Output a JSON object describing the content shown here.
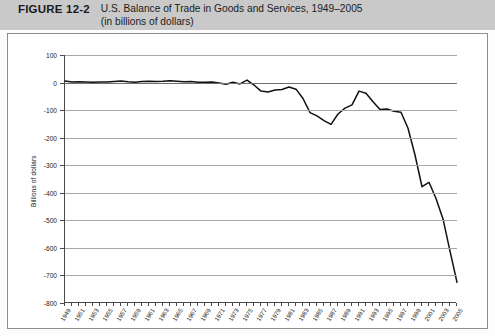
{
  "header": {
    "figure_label": "FIGURE 12-2",
    "title_line1": "U.S. Balance of Trade in Goods and Services, 1949–2005",
    "title_line2": "(in billions of dollars)"
  },
  "colors": {
    "header_band": "#c9c9c9",
    "line": "#111111",
    "grid": "#a8a8a8",
    "axis": "#4a4a4a",
    "plot_background": "#ffffff"
  },
  "chart_data": {
    "type": "line",
    "title": "U.S. Balance of Trade in Goods and Services, 1949–2005",
    "subtitle": "(in billions of dollars)",
    "xlabel": "",
    "ylabel": "Billions of dollars",
    "ylim": [
      -800,
      100
    ],
    "xlim": [
      1949,
      2005
    ],
    "grid": true,
    "legend": "none",
    "ytick_labels": [
      "100",
      "0",
      "-100",
      "-200",
      "-300",
      "-400",
      "-500",
      "-600",
      "-700",
      "-800"
    ],
    "ytick_values": [
      100,
      0,
      -100,
      -200,
      -300,
      -400,
      -500,
      -600,
      -700,
      -800
    ],
    "xtick_labels": [
      "1949",
      "1951",
      "1953",
      "1955",
      "1957",
      "1959",
      "1961",
      "1963",
      "1965",
      "1967",
      "1969",
      "1971",
      "1973",
      "1975",
      "1977",
      "1979",
      "1981",
      "1983",
      "1985",
      "1987",
      "1989",
      "1991",
      "1993",
      "1995",
      "1997",
      "1999",
      "2001",
      "2003",
      "2005"
    ],
    "series": [
      {
        "name": "U.S. Balance of Trade in Goods and Services",
        "x": [
          1949,
          1950,
          1951,
          1952,
          1953,
          1954,
          1955,
          1956,
          1957,
          1958,
          1959,
          1960,
          1961,
          1962,
          1963,
          1964,
          1965,
          1966,
          1967,
          1968,
          1969,
          1970,
          1971,
          1972,
          1973,
          1974,
          1975,
          1976,
          1977,
          1978,
          1979,
          1980,
          1981,
          1982,
          1983,
          1984,
          1985,
          1986,
          1987,
          1988,
          1989,
          1990,
          1991,
          1992,
          1993,
          1994,
          1995,
          1996,
          1997,
          1998,
          1999,
          2000,
          2001,
          2002,
          2003,
          2004,
          2005
        ],
        "values": [
          6,
          2,
          3,
          2,
          1,
          2,
          2,
          4,
          6,
          3,
          1,
          4,
          5,
          4,
          5,
          7,
          5,
          3,
          4,
          1,
          1,
          2,
          -2,
          -6,
          1,
          -5,
          9,
          -9,
          -31,
          -34,
          -27,
          -25,
          -16,
          -24,
          -58,
          -109,
          -121,
          -138,
          -152,
          -114,
          -93,
          -81,
          -31,
          -39,
          -70,
          -98,
          -96,
          -104,
          -108,
          -166,
          -263,
          -378,
          -362,
          -421,
          -495,
          -612,
          -725
        ]
      }
    ]
  }
}
